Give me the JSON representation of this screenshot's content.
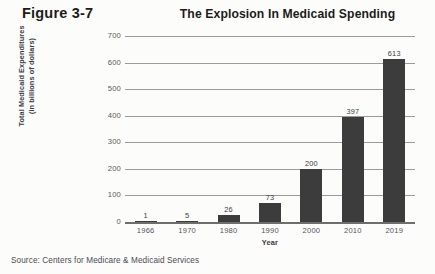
{
  "figure": {
    "tag": "Figure 3-7",
    "source": "Source: Centers for Medicare & Medicaid Services"
  },
  "chart_data": {
    "type": "bar",
    "title": "The Explosion In Medicaid Spending",
    "xlabel": "Year",
    "ylabel": "Total Medicaid Expenditures\n(in billions of dollars)",
    "ylabel_line1": "Total Medicaid Expenditures",
    "ylabel_line2": "(in billions of dollars)",
    "categories": [
      "1966",
      "1970",
      "1980",
      "1990",
      "2000",
      "2010",
      "2019"
    ],
    "values": [
      1,
      5,
      26,
      73,
      200,
      397,
      613
    ],
    "ylim": [
      0,
      700
    ],
    "yticks": [
      700,
      600,
      500,
      400,
      300,
      200,
      100,
      0
    ],
    "ytick_labels": [
      "700",
      "600",
      "500",
      "400",
      "300",
      "200",
      "100",
      "0"
    ],
    "value_labels": [
      "1",
      "5",
      "26",
      "73",
      "200",
      "397",
      "613"
    ],
    "grid": true,
    "legend": false,
    "bar_color": "#3c3c3c",
    "grid_color": "#9b9b9b",
    "background": "#fcfcfb"
  }
}
